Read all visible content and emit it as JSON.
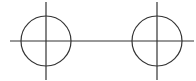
{
  "diagram": {
    "type": "technical-drawing",
    "stroke_color": "#333333",
    "background": "#ffffff",
    "centerline": {
      "x1": 10,
      "y1": 41,
      "x2": 194,
      "y2": 41
    },
    "circles": [
      {
        "id": "left-circle",
        "cx": 46,
        "cy": 41,
        "r": 25,
        "vertical_axis": {
          "y1": 2,
          "y2": 80
        }
      },
      {
        "id": "right-circle",
        "cx": 157,
        "cy": 41,
        "r": 25,
        "vertical_axis": {
          "y1": 2,
          "y2": 80
        }
      }
    ]
  }
}
